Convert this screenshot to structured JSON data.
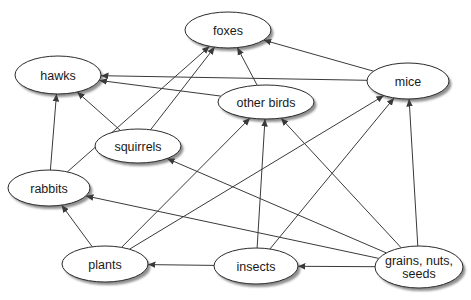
{
  "diagram": {
    "background_color": "#ffffff",
    "node_fill_color": "#ffffff",
    "node_stroke_color": "#2b2b2b",
    "node_shadow_color": "#8f8f8f",
    "edge_color": "#3a3a3a",
    "label_color": "#1a1a1a",
    "nodes": [
      {
        "id": "foxes",
        "label": "foxes",
        "x": 228,
        "y": 30,
        "rx": 43,
        "ry": 18
      },
      {
        "id": "hawks",
        "label": "hawks",
        "x": 58,
        "y": 75,
        "rx": 43,
        "ry": 19
      },
      {
        "id": "mice",
        "label": "mice",
        "x": 408,
        "y": 81,
        "rx": 41,
        "ry": 18
      },
      {
        "id": "other-birds",
        "label": "other birds",
        "x": 266,
        "y": 102,
        "rx": 48,
        "ry": 17
      },
      {
        "id": "squirrels",
        "label": "squirrels",
        "x": 138,
        "y": 146,
        "rx": 43,
        "ry": 17
      },
      {
        "id": "rabbits",
        "label": "rabbits",
        "x": 49,
        "y": 188,
        "rx": 41,
        "ry": 18
      },
      {
        "id": "plants",
        "label": "plants",
        "x": 105,
        "y": 264,
        "rx": 43,
        "ry": 18
      },
      {
        "id": "insects",
        "label": "insects",
        "x": 256,
        "y": 266,
        "rx": 42,
        "ry": 18
      },
      {
        "id": "grains",
        "label": "grains, nuts,\nseeds",
        "x": 419,
        "y": 267,
        "rx": 44,
        "ry": 21
      }
    ],
    "edges": [
      {
        "from": "squirrels",
        "to": "foxes"
      },
      {
        "from": "rabbits",
        "to": "foxes"
      },
      {
        "from": "other-birds",
        "to": "foxes"
      },
      {
        "from": "mice",
        "to": "foxes"
      },
      {
        "from": "mice",
        "to": "hawks"
      },
      {
        "from": "other-birds",
        "to": "hawks"
      },
      {
        "from": "squirrels",
        "to": "hawks"
      },
      {
        "from": "rabbits",
        "to": "hawks"
      },
      {
        "from": "plants",
        "to": "mice"
      },
      {
        "from": "insects",
        "to": "mice"
      },
      {
        "from": "grains",
        "to": "mice"
      },
      {
        "from": "plants",
        "to": "other-birds"
      },
      {
        "from": "insects",
        "to": "other-birds"
      },
      {
        "from": "grains",
        "to": "other-birds"
      },
      {
        "from": "grains",
        "to": "squirrels"
      },
      {
        "from": "plants",
        "to": "rabbits"
      },
      {
        "from": "grains",
        "to": "rabbits"
      },
      {
        "from": "grains",
        "to": "insects"
      },
      {
        "from": "insects",
        "to": "plants"
      }
    ]
  }
}
